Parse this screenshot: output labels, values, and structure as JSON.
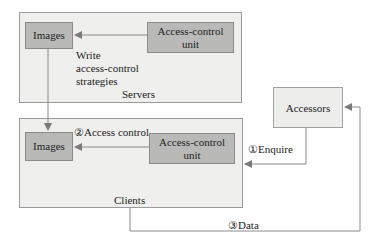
{
  "servers": {
    "label": "Servers",
    "images_label": "Images",
    "acu_label_line1": "Access-control",
    "acu_label_line2": "unit",
    "write_label_line1": "Write",
    "write_label_line2": "access-control",
    "write_label_line3": "strategies"
  },
  "clients": {
    "label": "Clients",
    "images_label": "Images",
    "acu_label_line1": "Access-control",
    "acu_label_line2": "unit",
    "access_control_label": "②Access control"
  },
  "accessors": {
    "label": "Accessors"
  },
  "edges": {
    "enquire_label": "①Enquire",
    "data_label": "③Data"
  },
  "colors": {
    "container_fill": "#efefed",
    "box_fill": "#b9b9b7",
    "line": "#8a8a8a"
  }
}
